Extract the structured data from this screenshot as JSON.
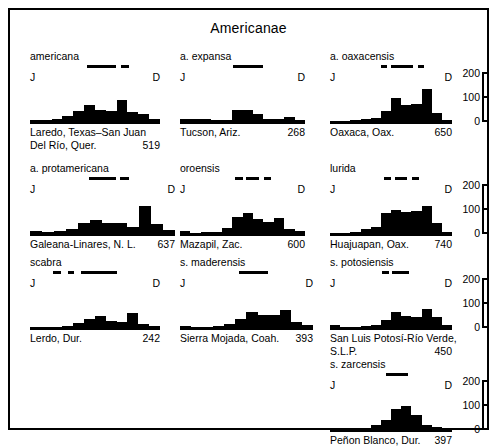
{
  "figure": {
    "title": "Americanae",
    "axis_start_label": "J",
    "axis_end_label": "D"
  },
  "scale": {
    "ticks": [
      "200",
      "100",
      "0"
    ]
  },
  "chart_data": {
    "type": "bar",
    "title": "Americanae",
    "xlabel": "Month (J = January to D = December)",
    "ylabel": "Number of plants in flower",
    "ylim": [
      0,
      200
    ],
    "grid": false,
    "legend": "none",
    "categories": [
      "J",
      "F",
      "M",
      "A",
      "M",
      "J",
      "J",
      "A",
      "S",
      "O",
      "N",
      "D"
    ],
    "panels": [
      {
        "taxon": "americana",
        "locality": "Laredo, Texas–San Juan Del Río, Quer.",
        "locality_line1": "Laredo, Texas–San Juan",
        "locality_line2": "Del Río, Quer.",
        "count": "519",
        "values": [
          12,
          12,
          14,
          30,
          60,
          92,
          62,
          60,
          118,
          52,
          40,
          14
        ],
        "flowering_segments": [
          {
            "start_pct": 44,
            "width_pct": 22
          },
          {
            "start_pct": 70,
            "width_pct": 6
          }
        ]
      },
      {
        "taxon": "a. expansa",
        "locality": "Tucson, Ariz.",
        "locality_line1": "Tucson, Ariz.",
        "locality_line2": "",
        "count": "268",
        "values": [
          14,
          14,
          14,
          10,
          8,
          62,
          62,
          40,
          14,
          14,
          24,
          10
        ],
        "flowering_segments": [
          {
            "start_pct": 42,
            "width_pct": 24
          }
        ]
      },
      {
        "taxon": "a. oaxacensis",
        "locality": "Oaxaca, Oax.",
        "locality_line1": "Oaxaca, Oax.",
        "locality_line2": "",
        "count": "650",
        "values": [
          4,
          6,
          10,
          16,
          22,
          60,
          124,
          92,
          96,
          172,
          46,
          10
        ],
        "flowering_segments": [
          {
            "start_pct": 42,
            "width_pct": 5
          },
          {
            "start_pct": 50,
            "width_pct": 18
          },
          {
            "start_pct": 72,
            "width_pct": 5
          }
        ]
      },
      {
        "taxon": "a. protamericana",
        "locality": "Galeana-Linares, N. L.",
        "locality_line1": "Galeana-Linares, N. L.",
        "locality_line2": "",
        "count": "637",
        "values": [
          16,
          12,
          14,
          28,
          60,
          72,
          60,
          60,
          36,
          150,
          52,
          20
        ],
        "flowering_segments": [
          {
            "start_pct": 41,
            "width_pct": 18
          },
          {
            "start_pct": 62,
            "width_pct": 6
          }
        ]
      },
      {
        "taxon": "oroensis",
        "locality": "Mazapil, Zac.",
        "locality_line1": "Mazapil, Zac.",
        "locality_line2": "",
        "count": "600",
        "values": [
          16,
          6,
          8,
          8,
          32,
          92,
          110,
          80,
          62,
          84,
          26,
          14
        ],
        "flowering_segments": [
          {
            "start_pct": 44,
            "width_pct": 6
          },
          {
            "start_pct": 53,
            "width_pct": 10
          },
          {
            "start_pct": 67,
            "width_pct": 6
          }
        ]
      },
      {
        "taxon": "lurida",
        "locality": "Huajuapan, Oax.",
        "locality_line1": "Huajuapan, Oax.",
        "locality_line2": "",
        "count": "740",
        "values": [
          6,
          6,
          10,
          24,
          36,
          110,
          128,
          118,
          120,
          150,
          60,
          8
        ],
        "flowering_segments": [
          {
            "start_pct": 44,
            "width_pct": 6
          },
          {
            "start_pct": 53,
            "width_pct": 10
          },
          {
            "start_pct": 67,
            "width_pct": 6
          }
        ]
      },
      {
        "taxon": "scabra",
        "locality": "Lerdo, Dur.",
        "locality_line1": "Lerdo, Dur.",
        "locality_line2": "",
        "count": "242",
        "values": [
          6,
          4,
          4,
          8,
          26,
          46,
          64,
          36,
          34,
          80,
          20,
          10
        ],
        "flowering_segments": [
          {
            "start_pct": 18,
            "width_pct": 6
          },
          {
            "start_pct": 29,
            "width_pct": 5
          },
          {
            "start_pct": 39,
            "width_pct": 28
          }
        ]
      },
      {
        "taxon": "s. maderensis",
        "locality": "Sierra Mojada, Coah.",
        "locality_line1": "Sierra Mojada, Coah.",
        "locality_line2": "",
        "count": "393",
        "values": [
          10,
          6,
          6,
          8,
          20,
          46,
          82,
          70,
          70,
          96,
          34,
          18
        ],
        "flowering_segments": [
          {
            "start_pct": 44,
            "width_pct": 22
          }
        ]
      },
      {
        "taxon": "s. potosiensis",
        "locality": "San Luis Potosí-Río Verde, S.L.P.",
        "locality_line1": "San Luis Potosí-Río Verde,",
        "locality_line2": "S.L.P.",
        "count": "450",
        "values": [
          16,
          6,
          6,
          10,
          14,
          42,
          82,
          64,
          60,
          100,
          60,
          16
        ],
        "flowering_segments": [
          {
            "start_pct": 43,
            "width_pct": 5
          },
          {
            "start_pct": 51,
            "width_pct": 14
          }
        ]
      },
      {
        "taxon": "s. zarcensis",
        "locality": "Peñon Blanco, Dur.",
        "locality_line1": "Peñon Blanco, Dur.",
        "locality_line2": "",
        "count": "397",
        "values": [
          4,
          4,
          4,
          8,
          26,
          54,
          110,
          124,
          80,
          26,
          14,
          6
        ],
        "flowering_segments": [
          {
            "start_pct": 46,
            "width_pct": 18
          }
        ]
      }
    ]
  }
}
